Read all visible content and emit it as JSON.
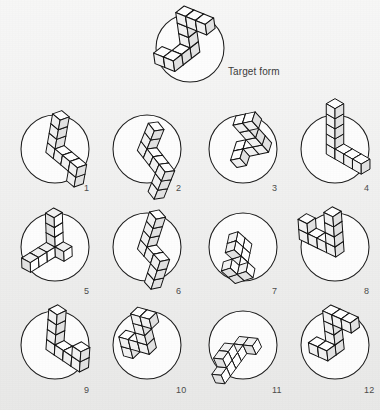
{
  "page": {
    "kind": "mental-rotation-test",
    "background_color": "#ededec",
    "ink_color": "#111111",
    "disc_fill": "#fdfdfd",
    "width": 380,
    "height": 410
  },
  "target": {
    "label": "Target form",
    "circle": {
      "cx": 190,
      "cy": 48,
      "r": 34
    },
    "figure_name": "target-block-figure",
    "description": "zigzag chain of ten cubes, upper arm sloping up-right, vertical mid section, lower arm kinked left-down",
    "rotation_deg": -8,
    "scale": 1.0
  },
  "options": [
    {
      "id": 1,
      "label": "1",
      "cx": 55,
      "cy": 149,
      "r": 34,
      "num_x": 84,
      "num_y": 183,
      "rotation_deg": 10,
      "scale": 0.92,
      "variant": "L-down-right"
    },
    {
      "id": 2,
      "label": "2",
      "cx": 147,
      "cy": 149,
      "r": 34,
      "num_x": 176,
      "num_y": 183,
      "rotation_deg": 22,
      "scale": 0.92,
      "variant": "V-wide"
    },
    {
      "id": 3,
      "label": "3",
      "cx": 243,
      "cy": 149,
      "r": 34,
      "num_x": 272,
      "num_y": 183,
      "rotation_deg": -42,
      "scale": 0.92,
      "variant": "L-tilted"
    },
    {
      "id": 4,
      "label": "4",
      "cx": 335,
      "cy": 149,
      "r": 34,
      "num_x": 364,
      "num_y": 183,
      "rotation_deg": 0,
      "scale": 0.95,
      "variant": "L-upright"
    },
    {
      "id": 5,
      "label": "5",
      "cx": 55,
      "cy": 247,
      "r": 34,
      "num_x": 84,
      "num_y": 286,
      "rotation_deg": 118,
      "scale": 0.92,
      "variant": "V-flat"
    },
    {
      "id": 6,
      "label": "6",
      "cx": 147,
      "cy": 247,
      "r": 34,
      "num_x": 176,
      "num_y": 286,
      "rotation_deg": 18,
      "scale": 0.92,
      "variant": "V-narrow"
    },
    {
      "id": 7,
      "label": "7",
      "cx": 243,
      "cy": 247,
      "r": 34,
      "num_x": 272,
      "num_y": 286,
      "rotation_deg": 72,
      "scale": 0.88,
      "variant": "flat-T"
    },
    {
      "id": 8,
      "label": "8",
      "cx": 335,
      "cy": 247,
      "r": 34,
      "num_x": 364,
      "num_y": 286,
      "rotation_deg": -4,
      "scale": 0.95,
      "variant": "L-corner"
    },
    {
      "id": 9,
      "label": "9",
      "cx": 55,
      "cy": 345,
      "r": 34,
      "num_x": 84,
      "num_y": 385,
      "rotation_deg": 4,
      "scale": 0.95,
      "variant": "L-block"
    },
    {
      "id": 10,
      "label": "10",
      "cx": 147,
      "cy": 345,
      "r": 34,
      "num_x": 176,
      "num_y": 385,
      "rotation_deg": -14,
      "scale": 0.92,
      "variant": "Z-hook"
    },
    {
      "id": 11,
      "label": "11",
      "cx": 243,
      "cy": 345,
      "r": 34,
      "num_x": 272,
      "num_y": 385,
      "rotation_deg": 96,
      "scale": 0.88,
      "variant": "flat-V"
    },
    {
      "id": 12,
      "label": "12",
      "cx": 335,
      "cy": 345,
      "r": 34,
      "num_x": 364,
      "num_y": 385,
      "rotation_deg": -6,
      "scale": 0.95,
      "variant": "zigzag-tall"
    }
  ]
}
